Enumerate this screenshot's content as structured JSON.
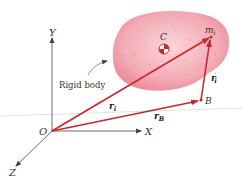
{
  "diagram": {
    "axes": {
      "x": "X",
      "y": "Y",
      "z": "Z",
      "origin": "O"
    },
    "points": {
      "center_of_mass": "C",
      "reference_point": "B",
      "particle": "m",
      "particle_sub": "i"
    },
    "vectors": {
      "r_i": {
        "base": "r",
        "sub": "i"
      },
      "r_B": {
        "base": "r",
        "sub": "B"
      },
      "r_i_prime": {
        "base": "r",
        "sub": "i",
        "prime": "′"
      }
    },
    "body_label": "Rigid body",
    "colors": {
      "body_fill": "#f2a3ae",
      "body_edge": "#e98a97",
      "vector": "#c8282c",
      "axis": "#444444",
      "horizon": "#d8dde2"
    }
  }
}
